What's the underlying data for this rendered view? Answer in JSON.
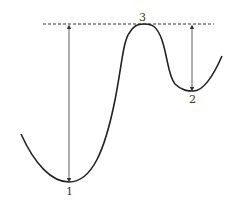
{
  "diagram": {
    "type": "energy-landscape",
    "labels": {
      "min1": "1",
      "min2": "2",
      "max3": "3"
    },
    "colors": {
      "curve": "#222222",
      "arrow": "#333333",
      "dashed": "#333333"
    }
  }
}
